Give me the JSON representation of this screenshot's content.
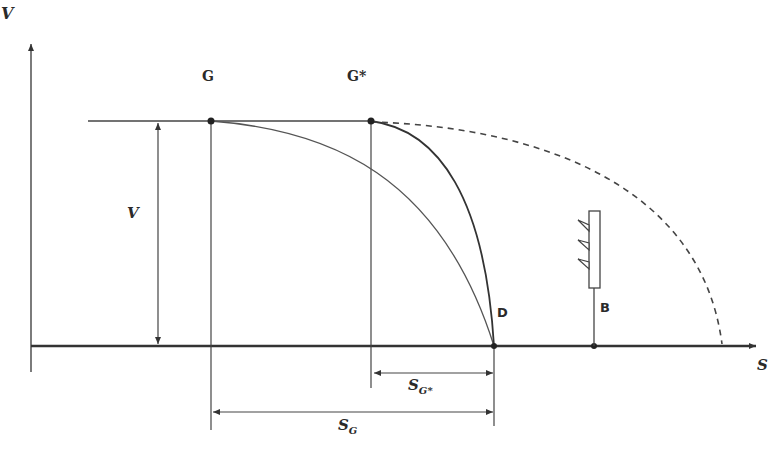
{
  "diagram": {
    "type": "braking-distance-diagram",
    "axes": {
      "y_label": "V",
      "x_label": "S"
    },
    "points": {
      "G": "G",
      "G_star": "G*",
      "D": "D",
      "B": "B"
    },
    "dimensions": {
      "speed": "V",
      "s_g_star": {
        "main": "S",
        "sub": "G*"
      },
      "s_g": {
        "main": "S",
        "sub": "G"
      }
    },
    "curves": [
      {
        "name": "braking-curve-from-G",
        "from": "G",
        "to": "D",
        "style": "solid-thin"
      },
      {
        "name": "braking-curve-from-G-star",
        "from": "G*",
        "to": "D",
        "style": "solid"
      },
      {
        "name": "unbraked-curve-from-G-star",
        "from": "G*",
        "to": "beyond B",
        "style": "dashed"
      }
    ],
    "signal": {
      "label": "B",
      "lamps": 3
    },
    "colors": {
      "line": "#333333",
      "axis": "#2a2a2a",
      "background": "#ffffff"
    }
  }
}
